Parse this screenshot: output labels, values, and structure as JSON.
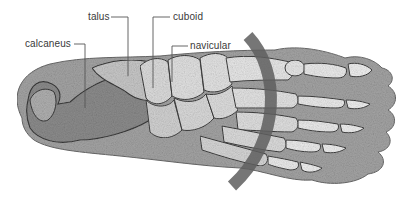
{
  "diagram": {
    "labels": [
      {
        "id": "calcaneus",
        "text": "calcaneus"
      },
      {
        "id": "talus",
        "text": "talus"
      },
      {
        "id": "cuboid",
        "text": "cuboid"
      },
      {
        "id": "navicular",
        "text": "navicular"
      }
    ],
    "colors": {
      "background": "#ffffff",
      "label_text": "#3a3a3a",
      "leader_line": "#555555",
      "arc": "#5e5e5e",
      "soft_tissue": "#9a9a9a",
      "bone_fill": "#e6e6e6",
      "bone_outline": "#3c3c3c"
    }
  }
}
